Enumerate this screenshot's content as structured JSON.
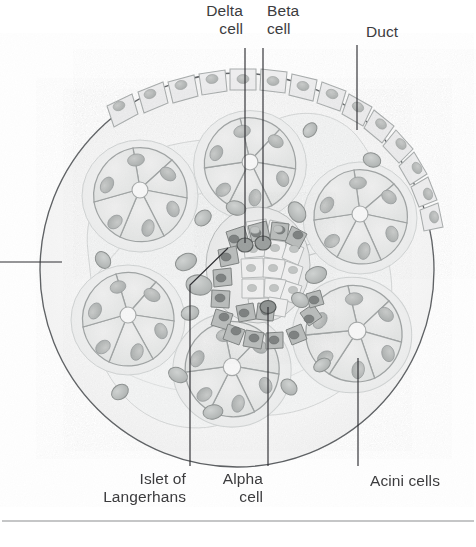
{
  "figure": {
    "type": "histology-cross-section",
    "background_color": "#ffffff",
    "ink_color": "#3c3c3e",
    "leader_color": "#2f2f33",
    "tissue_fill": "#fafafa",
    "acinus_fill": "#e9eaea",
    "acinus_stroke": "#a9adad",
    "nucleus_fill": "#b9bcbb",
    "islet_fill": "#ededed",
    "islet_dark_fill": "#a3a6a5",
    "capillary_fill": "#bdc0bf",
    "duct_fill": "#eceded",
    "rule_color": "#8b8d8f"
  },
  "labels": {
    "delta_cell": "Delta\ncell",
    "beta_cell": "Beta\ncell",
    "duct": "Duct",
    "islet": "Islet of\nLangerhans",
    "alpha_cell": "Alpha\ncell",
    "acini_cells": "Acini cells"
  },
  "label_lines": [
    {
      "name": "delta-cell",
      "text": "Delta\ncell",
      "align": "right",
      "text_x": 243,
      "text_y": 2,
      "line": [
        [
          245,
          48
        ],
        [
          245,
          243
        ]
      ]
    },
    {
      "name": "beta-cell",
      "text": "Beta\ncell",
      "align": "left",
      "text_x": 267,
      "text_y": 2,
      "line": [
        [
          263,
          48
        ],
        [
          263,
          241
        ]
      ]
    },
    {
      "name": "duct",
      "text": "Duct",
      "align": "left",
      "text_x": 366,
      "text_y": 23,
      "line": [
        [
          357,
          45
        ],
        [
          357,
          130
        ]
      ]
    },
    {
      "name": "islet-of-langerhans",
      "text": "Islet of\nLangerhans",
      "align": "right",
      "text_x": 186,
      "text_y": 470,
      "line": [
        [
          190,
          466
        ],
        [
          190,
          285
        ],
        [
          228,
          248
        ]
      ]
    },
    {
      "name": "alpha-cell",
      "text": "Alpha\ncell",
      "align": "right",
      "text_x": 263,
      "text_y": 470,
      "line": [
        [
          268,
          466
        ],
        [
          268,
          307
        ]
      ]
    },
    {
      "name": "acini-cells",
      "text": "Acini cells",
      "align": "left",
      "text_x": 370,
      "text_y": 472,
      "line": [
        [
          358,
          466
        ],
        [
          358,
          358
        ]
      ]
    }
  ],
  "structures": {
    "outline_circle": {
      "cx": 237,
      "cy": 270,
      "r": 197
    },
    "acini_count": 6,
    "islet": {
      "cx": 258,
      "cy": 265,
      "rx": 52,
      "ry": 58
    },
    "duct_cell_count": 14,
    "capillary_count": 16
  },
  "footer_rule": {
    "y": 521,
    "x1": 2,
    "x2": 474
  }
}
